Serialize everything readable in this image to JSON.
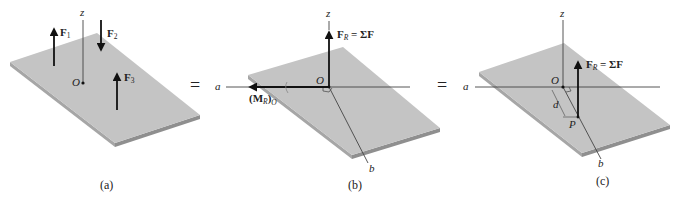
{
  "figure": {
    "colors": {
      "plate_top": "#c4c4c4",
      "plate_edge": "#9a9a9a",
      "line": "#222222",
      "background": "#ffffff"
    },
    "equals_sign": "=",
    "panels": [
      {
        "caption": "(a)",
        "labels": {
          "z_axis": "z",
          "origin": "O",
          "force_1": "F",
          "force_1_sub": "1",
          "force_2": "F",
          "force_2_sub": "2",
          "force_3": "F",
          "force_3_sub": "3"
        }
      },
      {
        "caption": "(b)",
        "labels": {
          "z_axis": "z",
          "origin": "O",
          "a_axis": "a",
          "b_axis": "b",
          "resultant_force": "F",
          "resultant_force_sub": "R",
          "resultant_force_eq": " = ΣF",
          "moment_open": "(M",
          "moment_sub_r": "R",
          "moment_close": ")",
          "moment_sub_o": "O"
        }
      },
      {
        "caption": "(c)",
        "labels": {
          "z_axis": "z",
          "origin": "O",
          "a_axis": "a",
          "b_axis": "b",
          "point": "P",
          "distance": "d",
          "resultant_force": "F",
          "resultant_force_sub": "R",
          "resultant_force_eq": " = ΣF"
        }
      }
    ]
  }
}
